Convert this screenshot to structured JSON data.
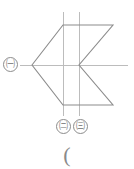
{
  "canvas": {
    "width": 134,
    "height": 169,
    "background": "#ffffff",
    "stroke_color": "#8c8c8c",
    "guide_color": "#b8b8b8"
  },
  "diagram": {
    "labels": {
      "a": "㈠",
      "b": "㈡",
      "c": "㈢"
    },
    "caption": "(",
    "vertices": {
      "left_point": [
        32,
        65
      ],
      "top_left": [
        63,
        25
      ],
      "top_right": [
        113,
        25
      ],
      "center_notch": [
        79,
        65
      ],
      "bottom_right": [
        113,
        105
      ],
      "bottom_left": [
        63,
        105
      ]
    },
    "guides": {
      "horizontal_axis": {
        "y": 65,
        "x1": 20,
        "x2": 128
      },
      "vertical_1": {
        "x": 63,
        "y1": 12,
        "y2": 116
      },
      "vertical_2": {
        "x": 79,
        "y1": 12,
        "y2": 116
      }
    }
  }
}
